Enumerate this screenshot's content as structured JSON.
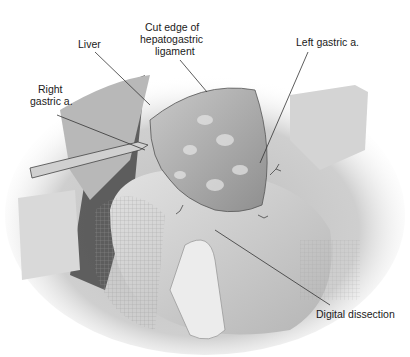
{
  "figure": {
    "type": "surgical-illustration",
    "colors": {
      "background": "#ffffff",
      "tissue_light": "#d8d8d8",
      "tissue_mid": "#a8a8a8",
      "tissue_dark": "#4a4a4a",
      "leader_line": "#333333"
    }
  },
  "labels": {
    "liver": "Liver",
    "cut_edge_line1": "Cut edge of",
    "cut_edge_line2": "hepatogastric",
    "cut_edge_line3": "ligament",
    "left_gastric": "Left gastric a.",
    "right_gastric_line1": "Right",
    "right_gastric_line2": "gastric a.",
    "digital_dissection": "Digital dissection"
  }
}
